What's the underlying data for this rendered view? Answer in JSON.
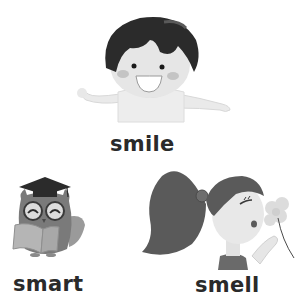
{
  "cards": [
    {
      "id": "smile",
      "word": "smile",
      "illustration": "smiling-boy"
    },
    {
      "id": "smart",
      "word": "smart",
      "illustration": "owl-graduate-reading"
    },
    {
      "id": "smell",
      "word": "smell",
      "illustration": "girl-smelling-flower"
    }
  ],
  "colors": {
    "text": "#2a2a2a",
    "hair_dark": "#2b2b2b",
    "skin": "#e6e6e6",
    "cheek": "#bdbdbd",
    "shirt": "#ececec",
    "owl_body": "#7a7a7a",
    "owl_wing": "#9a9a9a",
    "book": "#b5b5b5",
    "girl_hair": "#5a5a5a"
  }
}
